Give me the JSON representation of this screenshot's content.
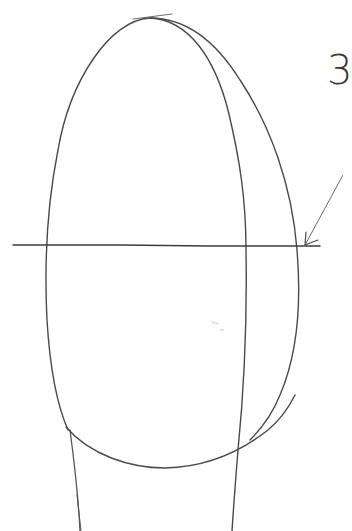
{
  "drawing": {
    "title": "Pencil sketch of head construction (egg shape with guide lines)",
    "step_number": "3",
    "stroke_color": "#4a4a4a",
    "light_stroke_color": "#8a8a8a",
    "background": "#ffffff",
    "elements": [
      "outer-egg-outline",
      "inner-center-curve",
      "horizontal-eye-line",
      "jaw-curve",
      "neck-lines",
      "pointer-arrow"
    ]
  }
}
